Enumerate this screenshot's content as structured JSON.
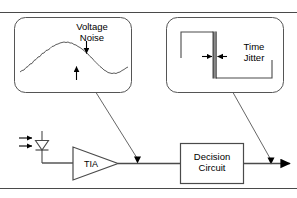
{
  "figure": {
    "type": "block-diagram",
    "rules": {
      "top_label": "top-horizontal-rule",
      "bottom_label": "bottom-horizontal-rule",
      "color": "#4a4a4a"
    },
    "colors": {
      "stroke": "#000000",
      "rule": "#4a4a4a",
      "callout_border": "#555555",
      "leader": "#555555",
      "background": "#ffffff"
    }
  },
  "callouts": [
    {
      "id": "voltage-noise",
      "label_line1": "Voltage",
      "label_line2": "Noise",
      "waveform": "noisy-sine-wave",
      "annotation": "two opposing arrows indicating vertical noise amplitude"
    },
    {
      "id": "time-jitter",
      "label_line1": "Time",
      "label_line2": "Jitter",
      "waveform": "square-pulse-falling-edge",
      "annotation": "two opposing arrows indicating horizontal edge uncertainty"
    }
  ],
  "circuit": {
    "photodiode": {
      "name": "photodiode",
      "light_arrows": 2
    },
    "amplifier": {
      "name": "transimpedance-amplifier",
      "label": "TIA"
    },
    "decision": {
      "name": "decision-circuit",
      "label_line1": "Decision",
      "label_line2": "Circuit"
    },
    "output": {
      "name": "output-arrow"
    }
  }
}
